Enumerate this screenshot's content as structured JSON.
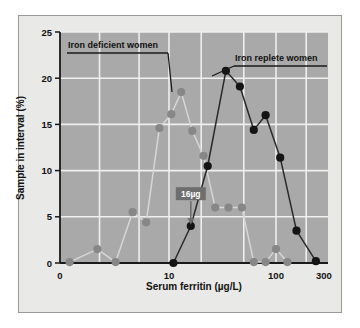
{
  "figure": {
    "background": "#e9e9e7",
    "plot_background": "#a9a9a9",
    "border_color": "#9a9a96",
    "grid_color": "#efefed",
    "axis_color": "#1a1a1a"
  },
  "chart_data": {
    "type": "line",
    "title": "",
    "xlabel": "Serum ferritin (µg/L)",
    "ylabel": "Sample in interval (%)",
    "xscale": "log",
    "xlim": [
      0.8,
      330
    ],
    "ylim": [
      0,
      25
    ],
    "xticks": [
      0,
      10,
      100,
      300
    ],
    "xtick_labels": [
      "0",
      "10",
      "100",
      "300"
    ],
    "yticks": [
      0,
      5,
      10,
      15,
      20,
      25
    ],
    "ytick_labels": [
      "0",
      "5",
      "10",
      "15",
      "20",
      "25"
    ],
    "grid": true,
    "legend_position": "inside-annotation",
    "series": [
      {
        "name": "Iron deficient women",
        "color": "#8a8a8a",
        "marker_color": "#878787",
        "line_color": "#d6d6d6",
        "x": [
          1.0,
          1.9,
          2.9,
          4.3,
          5.9,
          8.0,
          10.5,
          13.0,
          16.5,
          21.0,
          27.0,
          36.0,
          48.0,
          62.0,
          80.0,
          100.0,
          130.0
        ],
        "y": [
          0.1,
          1.5,
          0.1,
          5.5,
          4.4,
          14.6,
          16.1,
          18.5,
          14.3,
          11.6,
          6.0,
          6.0,
          6.0,
          0.1,
          0.1,
          1.5,
          0.1
        ]
      },
      {
        "name": "Iron replete women",
        "color": "#141414",
        "marker_color": "#141414",
        "line_color": "#2a2a2a",
        "x": [
          11.0,
          16.0,
          23.0,
          34.0,
          46.0,
          62.0,
          80.0,
          110.0,
          160.0,
          250.0
        ],
        "y": [
          0.0,
          4.0,
          10.5,
          20.8,
          19.1,
          14.4,
          16.0,
          11.4,
          3.5,
          0.2
        ]
      }
    ],
    "annotations": [
      {
        "label": "16µg",
        "x": 16.0,
        "y": 4.0,
        "box_fill": "#6e6e6e",
        "text_color": "#ffffff",
        "arrow": "down"
      }
    ]
  }
}
